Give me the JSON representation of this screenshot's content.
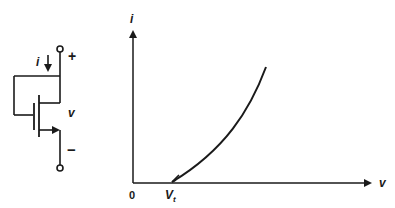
{
  "circuit": {
    "current_label": "i",
    "plus_label": "+",
    "voltage_label": "v",
    "minus_label": "−"
  },
  "graph": {
    "y_axis_label": "i",
    "x_axis_label": "v",
    "origin_label": "0",
    "threshold_label": "V",
    "threshold_subscript": "t"
  },
  "colors": {
    "stroke": "#1a1a1a",
    "background": "#ffffff"
  }
}
